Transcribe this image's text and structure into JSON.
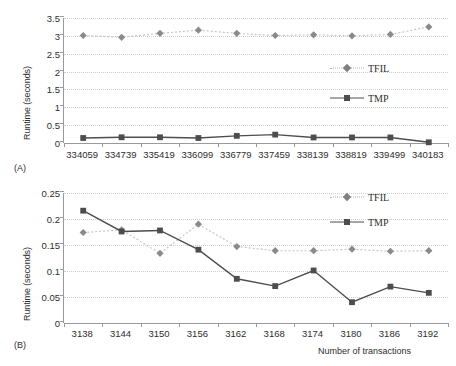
{
  "figure": {
    "panel_a_label": "(A)",
    "panel_b_label": "(B)"
  },
  "colors": {
    "tfil": "#9e9e9e",
    "tmp": "#4d4d4d",
    "axis": "#9a9a9a",
    "grid": "#cfcfcf",
    "text": "#2e2e2e",
    "background": "#ffffff"
  },
  "chart_data": [
    {
      "type": "line",
      "panel": "(A)",
      "title": "",
      "xlabel": "",
      "ylabel": "Runtime (seconds)",
      "categories": [
        "334059",
        "334739",
        "335419",
        "336099",
        "336779",
        "337459",
        "338139",
        "338819",
        "339499",
        "340183"
      ],
      "yticks": [
        "0",
        "0.5",
        "1",
        "1.5",
        "2",
        "2.5",
        "3",
        "3.5"
      ],
      "ylim": [
        0,
        3.5
      ],
      "grid": true,
      "legend_position": "center-right",
      "series": [
        {
          "name": "TFIL",
          "marker": "diamond",
          "values": [
            3.01,
            2.96,
            3.07,
            3.16,
            3.07,
            3.01,
            3.03,
            3.0,
            3.04,
            3.25
          ]
        },
        {
          "name": "TMP",
          "marker": "square",
          "values": [
            0.14,
            0.16,
            0.16,
            0.14,
            0.2,
            0.235,
            0.155,
            0.155,
            0.155,
            0.02
          ]
        }
      ]
    },
    {
      "type": "line",
      "panel": "(B)",
      "title": "",
      "xlabel": "Number of transactions",
      "ylabel": "Runtime (seconds)",
      "categories": [
        "3138",
        "3144",
        "3150",
        "3156",
        "3162",
        "3168",
        "3174",
        "3180",
        "3186",
        "3192"
      ],
      "yticks": [
        "0",
        "0.05",
        "0.1",
        "0.15",
        "0.2",
        "0.25"
      ],
      "ylim": [
        0,
        0.25
      ],
      "grid": true,
      "legend_position": "top-right",
      "series": [
        {
          "name": "TFIL",
          "marker": "diamond",
          "values": [
            0.174,
            0.179,
            0.134,
            0.19,
            0.147,
            0.139,
            0.139,
            0.142,
            0.138,
            0.139
          ]
        },
        {
          "name": "TMP",
          "marker": "square",
          "values": [
            0.216,
            0.176,
            0.178,
            0.141,
            0.085,
            0.071,
            0.101,
            0.04,
            0.07,
            0.058
          ]
        }
      ]
    }
  ],
  "legend": {
    "tfil_label": "TFIL",
    "tmp_label": "TMP"
  }
}
